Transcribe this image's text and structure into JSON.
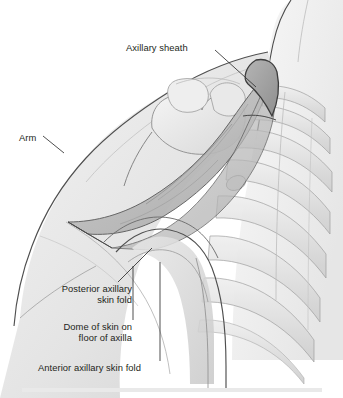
{
  "figure": {
    "view": "Anterolateral view of right shoulder and axilla with arm abducted",
    "style": "grayscale pencil medical illustration",
    "background_color": "#ffffff",
    "line_color": "#3a3a3a",
    "text_color": "#231f20"
  },
  "labels": [
    {
      "id": "axillary-sheath",
      "text": "Axillary sheath",
      "align": "left",
      "lines": [
        "Axillary sheath"
      ],
      "leader": "from label right edge down-right to apex of sheath"
    },
    {
      "id": "arm",
      "text": "Arm",
      "align": "left",
      "lines": [
        "Arm"
      ],
      "leader": "from label right edge down-right to arm contour"
    },
    {
      "id": "posterior-axillary-skin-fold",
      "text": "Posterior axillary skin fold",
      "align": "right",
      "lines": [
        "Posterior axillary",
        "skin fold"
      ],
      "leader": "from label top-right up-right to posterior fold"
    },
    {
      "id": "dome-of-skin-on-floor-of-axilla",
      "text": "Dome of skin on floor of axilla",
      "align": "right",
      "lines": [
        "Dome of skin on",
        "floor of axilla"
      ],
      "leader": "from label top-right up-right to dome of axillary floor"
    },
    {
      "id": "anterior-axillary-skin-fold",
      "text": "Anterior axillary skin fold",
      "align": "left",
      "lines": [
        "Anterior axillary skin fold"
      ],
      "leader": "from label top-right up and right to anterior fold"
    }
  ],
  "anatomy": {
    "structures": [
      "axillary sheath",
      "arm",
      "shoulder / humeral head",
      "clavicle",
      "rib cage",
      "posterior axillary skin fold",
      "dome of skin on floor of axilla",
      "anterior axillary skin fold",
      "neck contour",
      "chest wall"
    ]
  },
  "footer": {
    "band_color": "#e9e9e9"
  }
}
